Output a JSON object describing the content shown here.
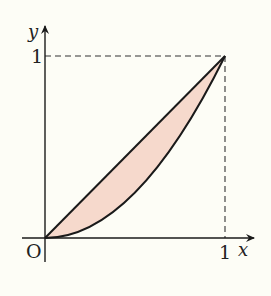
{
  "diagram": {
    "type": "function-area-plot",
    "colors": {
      "background": "#fdfdf6",
      "fill": "#f6d9cc",
      "stroke": "#1a1a1a"
    },
    "axes": {
      "x_label": "x",
      "y_label": "y",
      "origin_label": "O",
      "x_tick_label": "1",
      "y_tick_label": "1"
    },
    "curves": [
      {
        "name": "line",
        "equation": "y = x"
      },
      {
        "name": "parabola",
        "equation": "y = x^2"
      }
    ],
    "guides": [
      "dashed line from (0,1) to (1,1)",
      "dashed line from (1,0) to (1,1)"
    ]
  }
}
